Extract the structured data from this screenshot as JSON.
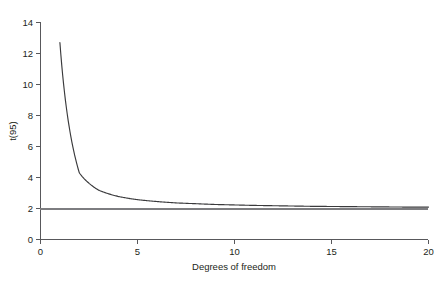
{
  "chart_data": {
    "type": "line",
    "title": "",
    "subtitle": "",
    "xlabel": "Degrees of freedom",
    "ylabel": "t(95)",
    "xlim": [
      0,
      20
    ],
    "ylim": [
      0,
      14
    ],
    "xticks": [
      "0",
      "5",
      "10",
      "15",
      "20"
    ],
    "xtick_values": [
      0,
      5,
      10,
      15,
      20
    ],
    "yticks": [
      "0",
      "2",
      "4",
      "6",
      "8",
      "10",
      "12",
      "14"
    ],
    "ytick_values": [
      0,
      2,
      4,
      6,
      8,
      10,
      12,
      14
    ],
    "grid": false,
    "legend": "none",
    "series": [
      {
        "name": "t(95) critical value",
        "color": "#3a3a3c",
        "x": [
          1,
          2,
          3,
          4,
          5,
          6,
          7,
          8,
          9,
          10,
          11,
          12,
          13,
          14,
          15,
          16,
          17,
          18,
          19,
          20
        ],
        "values": [
          12.71,
          4.3,
          3.18,
          2.78,
          2.57,
          2.45,
          2.36,
          2.31,
          2.26,
          2.23,
          2.2,
          2.18,
          2.16,
          2.14,
          2.13,
          2.12,
          2.11,
          2.1,
          2.09,
          2.09
        ]
      },
      {
        "name": "normal asymptote",
        "color": "#7d7d80",
        "x": [
          0,
          20
        ],
        "values": [
          1.96,
          1.96
        ]
      }
    ],
    "annotations": []
  },
  "axes": {
    "x_axis_name": "x-axis",
    "y_axis_name": "y-axis"
  }
}
